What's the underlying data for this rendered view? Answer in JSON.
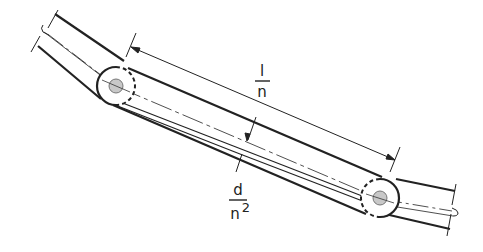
{
  "figure": {
    "type": "chain link / pin deflection diagram",
    "colors": {
      "line": "#222222",
      "thin_line": "#333333",
      "pin_fill": "#c8c8c8",
      "background": "#ffffff"
    }
  },
  "labels": {
    "length": {
      "numerator": "l",
      "denominator": "n"
    },
    "deflection": {
      "numerator": "d",
      "denominator_base": "n",
      "denominator_exponent": "2"
    }
  },
  "elements": {
    "pins": [
      {
        "name": "left-pin",
        "cx": 116,
        "cy": 86
      },
      {
        "name": "right-pin",
        "cx": 380,
        "cy": 198
      }
    ]
  }
}
